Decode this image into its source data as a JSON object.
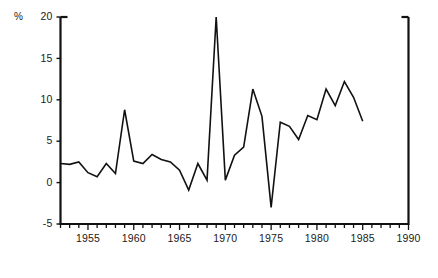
{
  "chart_data": {
    "type": "line",
    "title": "",
    "subtitle": "",
    "xlabel": "",
    "ylabel": "",
    "unit_label": "%",
    "grid": false,
    "legend": false,
    "legend_position": "none",
    "xlim": [
      1952,
      1990
    ],
    "ylim": [
      -5,
      20
    ],
    "y_ticks": [
      -5,
      0,
      5,
      10,
      15,
      20
    ],
    "y_tick_labels": [
      "-5",
      "0",
      "5",
      "10",
      "15",
      "20"
    ],
    "x_ticks": [
      1952,
      1953,
      1954,
      1955,
      1956,
      1957,
      1958,
      1959,
      1960,
      1961,
      1962,
      1963,
      1964,
      1965,
      1966,
      1967,
      1968,
      1969,
      1970,
      1971,
      1972,
      1973,
      1974,
      1975,
      1976,
      1977,
      1978,
      1979,
      1980,
      1981,
      1982,
      1983,
      1984,
      1985,
      1986,
      1987,
      1988,
      1989,
      1990
    ],
    "x_tick_labels_shown": [
      "1955",
      "1960",
      "1965",
      "1970",
      "1975",
      "1980",
      "1985",
      "1990"
    ],
    "x_labeled_ticks": [
      1955,
      1960,
      1965,
      1970,
      1975,
      1980,
      1985,
      1990
    ],
    "line_color": "#111111",
    "line_width": 1.6,
    "x": [
      1952,
      1953,
      1954,
      1955,
      1956,
      1957,
      1958,
      1959,
      1960,
      1961,
      1962,
      1963,
      1964,
      1965,
      1966,
      1967,
      1968,
      1969,
      1970,
      1971,
      1972,
      1973,
      1974,
      1975,
      1976,
      1977,
      1978,
      1979,
      1980,
      1981,
      1982,
      1983,
      1984,
      1985
    ],
    "values": [
      2.3,
      2.2,
      2.5,
      1.2,
      0.7,
      2.3,
      1.1,
      8.8,
      2.6,
      2.3,
      3.4,
      2.8,
      2.5,
      1.5,
      -0.9,
      2.3,
      0.3,
      20.0,
      0.3,
      3.3,
      4.3,
      11.3,
      8.0,
      -3.0,
      7.3,
      6.8,
      5.2,
      8.1,
      7.6,
      11.3,
      9.3,
      12.2,
      10.3,
      7.4
    ],
    "series": [
      {
        "name": "series-1",
        "values": [
          2.3,
          2.2,
          2.5,
          1.2,
          0.7,
          2.3,
          1.1,
          8.8,
          2.6,
          2.3,
          3.4,
          2.8,
          2.5,
          1.5,
          -0.9,
          2.3,
          0.3,
          20.0,
          0.3,
          3.3,
          4.3,
          11.3,
          8.0,
          -3.0,
          7.3,
          6.8,
          5.2,
          8.1,
          7.6,
          11.3,
          9.3,
          12.2,
          10.3,
          7.4
        ]
      }
    ],
    "annotations": []
  },
  "figure": {
    "background_color": "#ffffff",
    "axis_color": "#111111",
    "text_color": "#1a1a1a"
  }
}
